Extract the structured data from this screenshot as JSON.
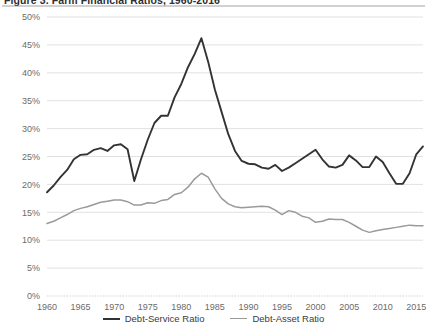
{
  "chart_data": {
    "type": "line",
    "title": "Figure 3. Farm Financial Ratios, 1960-2016",
    "xlabel": "",
    "ylabel": "",
    "xlim": [
      1960,
      2016
    ],
    "ylim": [
      0,
      50
    ],
    "grid": true,
    "legend_position": "bottom",
    "x_tick_labels": [
      "1960",
      "1965",
      "1970",
      "1975",
      "1980",
      "1985",
      "1990",
      "1995",
      "2000",
      "2005",
      "2010",
      "2015"
    ],
    "x_ticks": [
      1960,
      1965,
      1970,
      1975,
      1980,
      1985,
      1990,
      1995,
      2000,
      2005,
      2010,
      2015
    ],
    "y_tick_labels": [
      "0%",
      "5%",
      "10%",
      "15%",
      "20%",
      "25%",
      "30%",
      "35%",
      "40%",
      "45%",
      "50%"
    ],
    "y_ticks": [
      0,
      5,
      10,
      15,
      20,
      25,
      30,
      35,
      40,
      45,
      50
    ],
    "x": [
      1960,
      1961,
      1962,
      1963,
      1964,
      1965,
      1966,
      1967,
      1968,
      1969,
      1970,
      1971,
      1972,
      1973,
      1974,
      1975,
      1976,
      1977,
      1978,
      1979,
      1980,
      1981,
      1982,
      1983,
      1984,
      1985,
      1986,
      1987,
      1988,
      1989,
      1990,
      1991,
      1992,
      1993,
      1994,
      1995,
      1996,
      1997,
      1998,
      1999,
      2000,
      2001,
      2002,
      2003,
      2004,
      2005,
      2006,
      2007,
      2008,
      2009,
      2010,
      2011,
      2012,
      2013,
      2014,
      2015,
      2016
    ],
    "series": [
      {
        "name": "Debt-Service Ratio",
        "color": "#333333",
        "values": [
          18.6,
          19.8,
          21.3,
          22.6,
          24.5,
          25.3,
          25.4,
          26.2,
          26.5,
          26.0,
          27.0,
          27.2,
          26.3,
          20.6,
          24.5,
          28.0,
          31.0,
          32.3,
          32.3,
          35.6,
          38.0,
          41.0,
          43.4,
          46.2,
          42.0,
          37.0,
          33.0,
          29.0,
          26.0,
          24.2,
          23.7,
          23.6,
          23.0,
          22.8,
          23.5,
          22.4,
          23.0,
          23.8,
          24.6,
          25.4,
          26.2,
          24.5,
          23.2,
          23.0,
          23.5,
          25.2,
          24.3,
          23.1,
          23.1,
          25.0,
          24.0,
          22.0,
          20.1,
          20.1,
          22.0,
          25.4,
          26.8
        ]
      },
      {
        "name": "Debt-Asset Ratio",
        "color": "#9a9a9a",
        "values": [
          13.0,
          13.4,
          14.0,
          14.6,
          15.3,
          15.7,
          16.0,
          16.4,
          16.8,
          17.0,
          17.2,
          17.2,
          16.9,
          16.3,
          16.3,
          16.7,
          16.6,
          17.1,
          17.3,
          18.2,
          18.5,
          19.5,
          21.0,
          22.0,
          21.3,
          19.2,
          17.5,
          16.5,
          16.0,
          15.8,
          15.9,
          16.0,
          16.1,
          16.0,
          15.4,
          14.6,
          15.3,
          15.0,
          14.3,
          14.0,
          13.2,
          13.4,
          13.8,
          13.7,
          13.7,
          13.2,
          12.5,
          11.8,
          11.4,
          11.7,
          11.9,
          12.1,
          12.3,
          12.5,
          12.7,
          12.6,
          12.6
        ]
      }
    ]
  }
}
